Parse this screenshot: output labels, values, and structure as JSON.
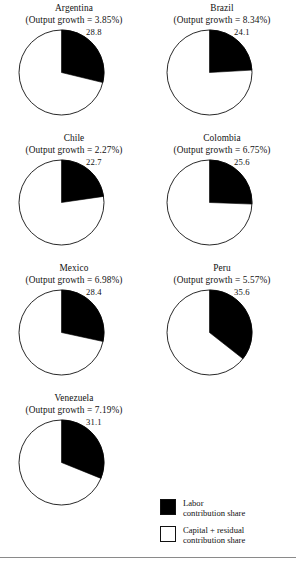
{
  "figure": {
    "panels": [
      {
        "country": "Argentina",
        "subtitle": "(Output growth = 3.85%)",
        "value_label": "28.8",
        "labor_share": 28.8,
        "capital_residual_share": 71.2
      },
      {
        "country": "Brazil",
        "subtitle": "(Output growth = 8.34%)",
        "value_label": "24.1",
        "labor_share": 24.1,
        "capital_residual_share": 75.9
      },
      {
        "country": "Chile",
        "subtitle": "(Output growth = 2.27%)",
        "value_label": "22.7",
        "labor_share": 22.7,
        "capital_residual_share": 77.3
      },
      {
        "country": "Colombia",
        "subtitle": "(Output growth = 6.75%)",
        "value_label": "25.6",
        "labor_share": 25.6,
        "capital_residual_share": 74.4
      },
      {
        "country": "Mexico",
        "subtitle": "(Output growth = 6.98%)",
        "value_label": "28.4",
        "labor_share": 28.4,
        "capital_residual_share": 71.6
      },
      {
        "country": "Peru",
        "subtitle": "(Output growth = 5.57%)",
        "value_label": "35.6",
        "labor_share": 35.6,
        "capital_residual_share": 64.4
      },
      {
        "country": "Venezuela",
        "subtitle": "(Output growth = 7.19%)",
        "value_label": "31.1",
        "labor_share": 31.1,
        "capital_residual_share": 68.9
      }
    ],
    "legend": {
      "items": [
        {
          "swatch": "filled",
          "line1": "Labor",
          "line2": "contribution share",
          "color": "#000000"
        },
        {
          "swatch": "empty",
          "line1": "Capital + residual",
          "line2": "contribution share",
          "color": "#ffffff"
        }
      ]
    }
  },
  "chart_data": {
    "type": "pie",
    "title": "",
    "subtitle": "",
    "xlabel": "",
    "ylabel": "",
    "grid": false,
    "legend_position": "bottom-right",
    "units": "percent",
    "slice_start_angle_deg": 0,
    "slice_direction": "clockwise",
    "legend_entries": [
      "Labor contribution share",
      "Capital + residual contribution share"
    ],
    "slice_colors": [
      "#000000",
      "#ffffff"
    ],
    "panels": [
      {
        "name": "Argentina",
        "annotation": "(Output growth = 3.85%)",
        "output_growth_pct": 3.85,
        "labels": [
          "Labor contribution share",
          "Capital + residual contribution share"
        ],
        "values": [
          28.8,
          71.2
        ],
        "data_label": "28.8"
      },
      {
        "name": "Brazil",
        "annotation": "(Output growth = 8.34%)",
        "output_growth_pct": 8.34,
        "labels": [
          "Labor contribution share",
          "Capital + residual contribution share"
        ],
        "values": [
          24.1,
          75.9
        ],
        "data_label": "24.1"
      },
      {
        "name": "Chile",
        "annotation": "(Output growth = 2.27%)",
        "output_growth_pct": 2.27,
        "labels": [
          "Labor contribution share",
          "Capital + residual contribution share"
        ],
        "values": [
          22.7,
          77.3
        ],
        "data_label": "22.7"
      },
      {
        "name": "Colombia",
        "annotation": "(Output growth = 6.75%)",
        "output_growth_pct": 6.75,
        "labels": [
          "Labor contribution share",
          "Capital + residual contribution share"
        ],
        "values": [
          25.6,
          74.4
        ],
        "data_label": "25.6"
      },
      {
        "name": "Mexico",
        "annotation": "(Output growth = 6.98%)",
        "output_growth_pct": 6.98,
        "labels": [
          "Labor contribution share",
          "Capital + residual contribution share"
        ],
        "values": [
          28.4,
          71.6
        ],
        "data_label": "28.4"
      },
      {
        "name": "Peru",
        "annotation": "(Output growth = 5.57%)",
        "output_growth_pct": 5.57,
        "labels": [
          "Labor contribution share",
          "Capital + residual contribution share"
        ],
        "values": [
          35.6,
          64.4
        ],
        "data_label": "35.6"
      },
      {
        "name": "Venezuela",
        "annotation": "(Output growth = 7.19%)",
        "output_growth_pct": 7.19,
        "labels": [
          "Labor contribution share",
          "Capital + residual contribution share"
        ],
        "values": [
          31.1,
          68.9
        ],
        "data_label": "31.1"
      }
    ]
  }
}
